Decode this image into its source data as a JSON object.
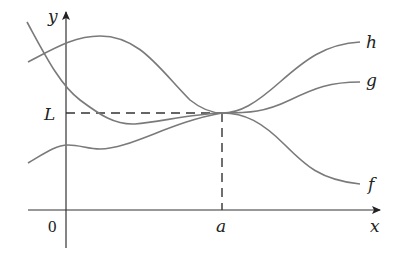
{
  "diagram": {
    "type": "squeeze-theorem-illustration",
    "axes": {
      "x_label": "x",
      "y_label": "y",
      "origin_label": "0"
    },
    "markers": {
      "x_tick_label": "a",
      "y_tick_label": "L"
    },
    "curves": [
      {
        "name": "h",
        "label": "h",
        "color": "#7a7a7a",
        "description": "upper function, touches L at a from above"
      },
      {
        "name": "g",
        "label": "g",
        "color": "#7a7a7a",
        "description": "middle function, passes through (a, L)"
      },
      {
        "name": "f",
        "label": "f",
        "color": "#7a7a7a",
        "description": "lower function, touches L at a from below"
      }
    ],
    "guides": [
      {
        "type": "dashed-horizontal",
        "at": "L",
        "from": "y-axis",
        "to": "a"
      },
      {
        "type": "dashed-vertical",
        "at": "a",
        "from": "x-axis",
        "to": "L"
      }
    ]
  }
}
